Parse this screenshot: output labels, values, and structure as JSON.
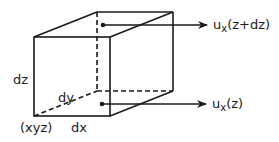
{
  "diagram": {
    "type": "differential cube element with velocity profile",
    "colors": {
      "stroke": "#1a1a1a",
      "background": "#ffffff"
    },
    "labels": {
      "height": "dz",
      "depth": "dy",
      "width": "dx",
      "origin": "(xyz)"
    },
    "arrows": [
      {
        "base": "u",
        "subscript": "x",
        "arg": "(z+dz)"
      },
      {
        "base": "u",
        "subscript": "x",
        "arg": "(z)"
      }
    ]
  }
}
